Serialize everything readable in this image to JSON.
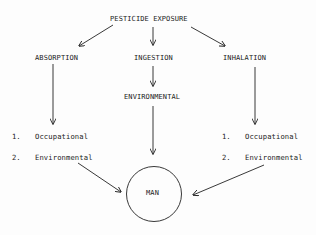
{
  "diagram": {
    "root": {
      "label": "PESTICIDE EXPOSURE"
    },
    "routes": [
      {
        "label": "ABSORPTION"
      },
      {
        "label": "INGESTION"
      },
      {
        "label": "INHALATION"
      }
    ],
    "ingestion_source": {
      "label": "ENVIRONMENTAL"
    },
    "absorption_sources": [
      {
        "num": "1.",
        "label": "Occupational"
      },
      {
        "num": "2.",
        "label": "Environmental"
      }
    ],
    "inhalation_sources": [
      {
        "num": "1.",
        "label": "Occupational"
      },
      {
        "num": "2.",
        "label": "Environmental"
      }
    ],
    "target": {
      "label": "MAN"
    },
    "colors": {
      "ink": "#222222",
      "background": "#fdfdfd"
    }
  }
}
